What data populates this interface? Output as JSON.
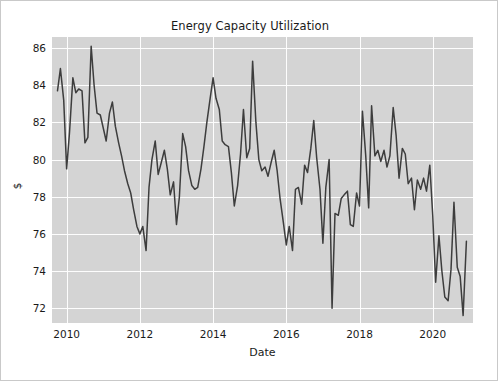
{
  "chart_data": {
    "type": "line",
    "title": "Energy Capacity Utilization",
    "xlabel": "Date",
    "ylabel": "$",
    "xlim": [
      2009.6,
      2021.1
    ],
    "ylim": [
      71.2,
      86.6
    ],
    "grid": true,
    "legend": null,
    "line_color": "#3d3d3d",
    "plot_background": "#d4d4d4",
    "grid_color": "#fdfdfd",
    "figure_background": "#ffffff",
    "xticks": [
      2010,
      2012,
      2014,
      2016,
      2018,
      2020
    ],
    "xtick_labels": [
      "2010",
      "2012",
      "2014",
      "2016",
      "2018",
      "2020"
    ],
    "yticks": [
      72,
      74,
      76,
      78,
      80,
      82,
      84,
      86
    ],
    "ytick_labels": [
      "72",
      "74",
      "76",
      "78",
      "80",
      "82",
      "84",
      "86"
    ],
    "series": [
      {
        "name": "Energy Capacity Utilization",
        "x": [
          2009.75,
          2009.83,
          2009.92,
          2010.0,
          2010.08,
          2010.17,
          2010.25,
          2010.33,
          2010.42,
          2010.5,
          2010.58,
          2010.67,
          2010.75,
          2010.83,
          2010.92,
          2011.0,
          2011.08,
          2011.17,
          2011.25,
          2011.33,
          2011.42,
          2011.5,
          2011.58,
          2011.67,
          2011.75,
          2011.83,
          2011.92,
          2012.0,
          2012.08,
          2012.17,
          2012.25,
          2012.33,
          2012.42,
          2012.5,
          2012.58,
          2012.67,
          2012.75,
          2012.83,
          2012.92,
          2013.0,
          2013.08,
          2013.17,
          2013.25,
          2013.33,
          2013.42,
          2013.5,
          2013.58,
          2013.67,
          2013.75,
          2013.83,
          2013.92,
          2014.0,
          2014.08,
          2014.17,
          2014.25,
          2014.33,
          2014.42,
          2014.5,
          2014.58,
          2014.67,
          2014.75,
          2014.83,
          2014.92,
          2015.0,
          2015.08,
          2015.17,
          2015.25,
          2015.33,
          2015.42,
          2015.5,
          2015.58,
          2015.67,
          2015.75,
          2015.83,
          2015.92,
          2016.0,
          2016.08,
          2016.17,
          2016.25,
          2016.33,
          2016.42,
          2016.5,
          2016.58,
          2016.67,
          2016.75,
          2016.83,
          2016.92,
          2017.0,
          2017.08,
          2017.17,
          2017.25,
          2017.33,
          2017.42,
          2017.5,
          2017.58,
          2017.67,
          2017.75,
          2017.83,
          2017.92,
          2018.0,
          2018.08,
          2018.17,
          2018.25,
          2018.33,
          2018.42,
          2018.5,
          2018.58,
          2018.67,
          2018.75,
          2018.83,
          2018.92,
          2019.0,
          2019.08,
          2019.17,
          2019.25,
          2019.33,
          2019.42,
          2019.5,
          2019.58,
          2019.67,
          2019.75,
          2019.83,
          2019.92,
          2020.0,
          2020.08,
          2020.17,
          2020.25,
          2020.33,
          2020.42,
          2020.5,
          2020.58,
          2020.67,
          2020.75,
          2020.83,
          2020.92
        ],
        "y": [
          83.7,
          84.9,
          83.2,
          79.5,
          81.5,
          84.4,
          83.6,
          83.8,
          83.7,
          80.9,
          81.2,
          86.1,
          84.0,
          82.5,
          82.4,
          81.7,
          81.0,
          82.5,
          83.1,
          81.8,
          80.9,
          80.2,
          79.4,
          78.7,
          78.2,
          77.3,
          76.4,
          76.0,
          76.4,
          75.1,
          78.5,
          80.0,
          81.0,
          79.2,
          79.8,
          80.5,
          79.5,
          78.1,
          78.8,
          76.5,
          78.0,
          81.4,
          80.7,
          79.4,
          78.6,
          78.4,
          78.5,
          79.5,
          80.7,
          82.0,
          83.3,
          84.4,
          83.3,
          82.7,
          81.0,
          80.8,
          80.7,
          79.3,
          77.5,
          78.6,
          80.3,
          82.7,
          80.1,
          80.6,
          85.3,
          82.0,
          80.0,
          79.4,
          79.6,
          79.1,
          79.8,
          80.5,
          79.4,
          77.9,
          76.6,
          75.4,
          76.4,
          75.1,
          78.4,
          78.5,
          77.6,
          79.7,
          79.3,
          80.6,
          82.1,
          80.1,
          78.4,
          75.5,
          78.5,
          80.0,
          72.0,
          77.1,
          77.0,
          77.9,
          78.1,
          78.3,
          76.5,
          76.4,
          78.2,
          77.5,
          82.6,
          80.2,
          77.4,
          82.9,
          80.2,
          80.5,
          79.9,
          80.5,
          79.6,
          80.2,
          82.8,
          81.3,
          79.0,
          80.6,
          80.3,
          78.7,
          79.0,
          77.3,
          78.9,
          78.4,
          79.0,
          78.3,
          79.7,
          77.0,
          73.4,
          75.9,
          74.0,
          72.6,
          72.4,
          74.1,
          77.7,
          74.2,
          73.7,
          71.6,
          75.6
        ]
      }
    ]
  }
}
